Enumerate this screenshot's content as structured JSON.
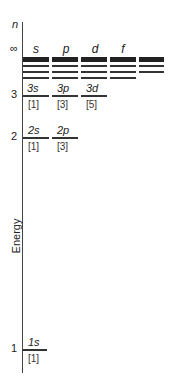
{
  "axis": {
    "n_label": "n",
    "infinity_label": "∞",
    "energy_label": "Energy",
    "ticks": [
      "3",
      "2",
      "1"
    ]
  },
  "columns": [
    "s",
    "p",
    "d",
    "f"
  ],
  "levels": {
    "n3": [
      {
        "label": "3s",
        "degeneracy": "[1]"
      },
      {
        "label": "3p",
        "degeneracy": "[3]"
      },
      {
        "label": "3d",
        "degeneracy": "[5]"
      }
    ],
    "n2": [
      {
        "label": "2s",
        "degeneracy": "[1]"
      },
      {
        "label": "2p",
        "degeneracy": "[3]"
      }
    ],
    "n1": [
      {
        "label": "1s",
        "degeneracy": "[1]"
      }
    ]
  }
}
